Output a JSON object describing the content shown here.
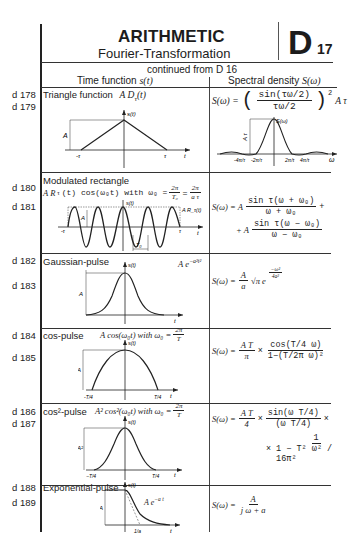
{
  "header": {
    "title": "ARITHMETIC",
    "subtitle": "Fourier-Transformation",
    "section_letter": "D",
    "section_number": "17",
    "continued": "continued from D 16"
  },
  "columns": {
    "left": "Time function s(t)",
    "left_prefix": "Time function ",
    "left_symbol": "s(t)",
    "right_prefix": "Spectral density ",
    "right_symbol": "S(ω)"
  },
  "rows": [
    {
      "labels": [
        "d 178",
        "d 179"
      ],
      "name": "Triangle function",
      "time_expr": "A D_τ(t)",
      "time_expr_display": "A  D",
      "time_sub": "τ",
      "time_arg": "(t)",
      "spectral": "S(ω) = (sin(τω/2) / (τω/2))² A τ",
      "spectral_lhs": "S(ω) =",
      "spectral_num": "sin(τω/2)",
      "spectral_den": "τω/2",
      "spectral_tail": "A τ",
      "graph_labels": {
        "y": "s(t)",
        "amp": "A",
        "neg": "-τ",
        "pos": "τ",
        "x": "t"
      },
      "spec_graph_labels": {
        "y": "S(ω)",
        "amp": "A τ",
        "ticks": [
          "-4π/τ",
          "-2π/τ",
          "2π/τ",
          "4π/τ"
        ],
        "x": "ω"
      }
    },
    {
      "labels": [
        "d 180",
        "d 181"
      ],
      "name": "Modulated rectangle",
      "time_expr": "A R_τ(t) cos(ω₀t) with ω₀ = 2π/T₀ = 2π/(aτ)",
      "time_expr_display": "A R",
      "time_sub": "τ",
      "time_arg": "(t)  cos(ω₀t)  with  ω₀ =",
      "frac1_num": "2π",
      "frac1_den": "T₀",
      "frac2_num": "2π",
      "frac2_den": "a τ",
      "spectral_line1_lhs": "S(ω) =  A",
      "spectral_line1_num": "sin τ(ω + ω₀)",
      "spectral_line1_den": "ω + ω₀",
      "spectral_line2_lhs": "+  A",
      "spectral_line2_num": "sin τ(ω − ω₀)",
      "spectral_line2_den": "ω − ω₀",
      "graph_labels": {
        "y": "s(t)",
        "amp": "A",
        "neg": "-τ",
        "pos": "τ",
        "x": "t",
        "envelope": "A R_τ(t)",
        "period": "T₀"
      }
    },
    {
      "labels": [
        "d 182",
        "d 183"
      ],
      "name": "Gaussian-pulse",
      "time_expr": "A e^(−a²t²)",
      "time_coef": "A  e",
      "time_exp": "−a²t²",
      "spectral": "S(ω) = (A/a) √π e^(−ω²/4a²)",
      "spectral_lhs": "S(ω) =",
      "spectral_num": "A",
      "spectral_den": "a",
      "spectral_root": "√π  e",
      "spectral_exp_num": "−ω²",
      "spectral_exp_den": "4a²",
      "graph_labels": {
        "y": "s(t)",
        "amp": "A",
        "x": "t"
      }
    },
    {
      "labels": [
        "d 184",
        "d 185"
      ],
      "name": "cos-pulse",
      "time_expr": "A cos(ω₀t) with ω₀ = 2π/T",
      "time_display": "A  cos(ω₀t) with  ω₀ =",
      "frac_num": "2π",
      "frac_den": "T",
      "spectral": "S(ω) = (A T / π) × cos(Tω/4) / (1 − (Tω/2π)²)",
      "spectral_lhs": "S(ω) =",
      "coef_num": "A  T",
      "coef_den": "π",
      "main_num": "cos(T/4 ω)",
      "main_den": "1−(T/2π ω)²",
      "graph_labels": {
        "y": "s(t)",
        "amp": "A",
        "neg": "-T/4",
        "pos": "T/4",
        "x": "t"
      }
    },
    {
      "labels": [
        "d 186",
        "d 187"
      ],
      "name": "cos²-pulse",
      "time_expr": "A² cos²(ω₀t) with ω₀ = 2π/T",
      "time_display": "A²  cos²(ω₀t) with  ω₀ =",
      "frac_num": "2π",
      "frac_den": "T",
      "spectral": "S(ω) = (A T / 4) × sin(ωT/4)/(ωT/4) × 1/(1 − T²ω²/16π²)",
      "spectral_lhs": "S(ω) =",
      "coef_num": "A  T",
      "coef_den": "4",
      "main_num": "sin(ω T/4)",
      "main_den": "(ω T/4)",
      "line2_num": "1",
      "line2_den": "1 − T² ω² / 16π²",
      "graph_labels": {
        "y": "s(t)",
        "amp": "A²",
        "neg": "−T/4",
        "pos": "T/4",
        "x": "t"
      }
    },
    {
      "labels": [
        "d 188",
        "d 189"
      ],
      "name": "Exponential-pulse",
      "time_expr": "A e^(−at)",
      "curve_label": "A  e",
      "curve_exp": "−a t",
      "spectral": "S(ω) = A / (jω + a)",
      "spectral_lhs": "S(ω) =",
      "spectral_num": "A",
      "spectral_den": "j ω  +  a",
      "graph_labels": {
        "y": "s(t)",
        "amp": "A",
        "tick": "1/a",
        "x": "t"
      }
    }
  ]
}
